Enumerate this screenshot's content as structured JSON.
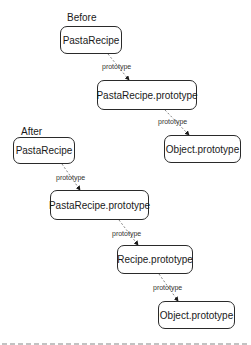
{
  "diagram": {
    "before": {
      "label": "Before",
      "nodes": [
        {
          "id": "pastarecipe",
          "label": "PastaRecipe"
        },
        {
          "id": "pastarecipe-prototype",
          "label": "PastaRecipe.prototype"
        },
        {
          "id": "object-prototype",
          "label": "Object.prototype"
        }
      ],
      "edges": [
        {
          "from": "pastarecipe",
          "to": "pastarecipe-prototype",
          "label": "prototype"
        },
        {
          "from": "pastarecipe-prototype",
          "to": "object-prototype",
          "label": "prototype"
        }
      ]
    },
    "after": {
      "label": "After",
      "nodes": [
        {
          "id": "pastarecipe",
          "label": "PastaRecipe"
        },
        {
          "id": "pastarecipe-prototype",
          "label": "PastaRecipe.prototype"
        },
        {
          "id": "recipe-prototype",
          "label": "Recipe.prototype"
        },
        {
          "id": "object-prototype",
          "label": "Object.prototype"
        }
      ],
      "edges": [
        {
          "from": "pastarecipe",
          "to": "pastarecipe-prototype",
          "label": "prototype"
        },
        {
          "from": "pastarecipe-prototype",
          "to": "recipe-prototype",
          "label": "prototype"
        },
        {
          "from": "recipe-prototype",
          "to": "object-prototype",
          "label": "prototype"
        }
      ]
    },
    "caption": {
      "legible": false,
      "note": "clipped at bottom edge; text not readable"
    }
  }
}
